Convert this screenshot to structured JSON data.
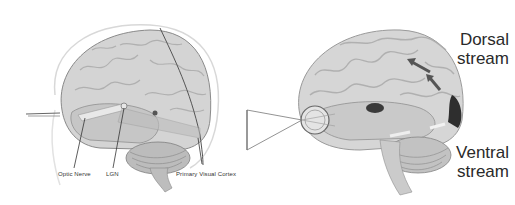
{
  "left_figure": {
    "labels": {
      "optic_nerve": "Optic Nerve",
      "lgn": "LGN",
      "primary_visual_cortex": "Primary Visual Cortex"
    }
  },
  "right_figure": {
    "labels": {
      "dorsal_line1": "Dorsal",
      "dorsal_line2": "stream",
      "ventral_line1": "Ventral",
      "ventral_line2": "stream"
    }
  },
  "colors": {
    "brain_fill": "#cfcfcf",
    "brain_shade": "#a9a9a9",
    "outline": "#6e6e6e",
    "text": "#2a2a2a",
    "background": "#ffffff"
  }
}
